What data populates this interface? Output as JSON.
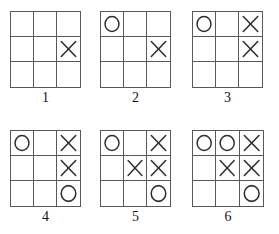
{
  "figure": {
    "type": "tic-tac-toe-sequence",
    "background_color": "#ffffff",
    "grid_line_color": "#58585a",
    "mark_color": "#2e2e30",
    "rows": 3,
    "cols": 3,
    "mark_names": {
      "X": "x-mark",
      "O": "o-mark",
      "": "empty-cell"
    },
    "top_clipped_text": "",
    "boards": [
      {
        "label": "1",
        "x": 10,
        "y": 11,
        "width": 71,
        "height": 77,
        "label_y": 91,
        "cells": [
          [
            "",
            "",
            ""
          ],
          [
            "",
            "",
            "X"
          ],
          [
            "",
            "",
            ""
          ]
        ]
      },
      {
        "label": "2",
        "x": 100,
        "y": 11,
        "width": 71,
        "height": 77,
        "label_y": 91,
        "cells": [
          [
            "O",
            "",
            ""
          ],
          [
            "",
            "",
            "X"
          ],
          [
            "",
            "",
            ""
          ]
        ]
      },
      {
        "label": "3",
        "x": 192,
        "y": 11,
        "width": 71,
        "height": 77,
        "label_y": 91,
        "cells": [
          [
            "O",
            "",
            "X"
          ],
          [
            "",
            "",
            "X"
          ],
          [
            "",
            "",
            ""
          ]
        ]
      },
      {
        "label": "4",
        "x": 10,
        "y": 130,
        "width": 71,
        "height": 77,
        "label_y": 210,
        "cells": [
          [
            "O",
            "",
            "X"
          ],
          [
            "",
            "",
            "X"
          ],
          [
            "",
            "",
            "O"
          ]
        ]
      },
      {
        "label": "5",
        "x": 100,
        "y": 130,
        "width": 71,
        "height": 77,
        "label_y": 210,
        "cells": [
          [
            "O",
            "",
            "X"
          ],
          [
            "",
            "X",
            "X"
          ],
          [
            "",
            "",
            "O"
          ]
        ]
      },
      {
        "label": "6",
        "x": 192,
        "y": 130,
        "width": 72,
        "height": 77,
        "label_y": 210,
        "cells": [
          [
            "O",
            "O",
            "X"
          ],
          [
            "",
            "X",
            "X"
          ],
          [
            "",
            "",
            "O"
          ]
        ]
      }
    ]
  }
}
